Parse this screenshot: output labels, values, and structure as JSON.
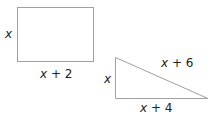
{
  "rectangle": {
    "height_label": "x",
    "width_label_var": "x",
    "width_label_op": " + 2"
  },
  "triangle": {
    "height_label": "x",
    "base_label_var": "x",
    "base_label_op": " + 4",
    "hypotenuse_label_var": "x",
    "hypotenuse_label_op": " + 6"
  },
  "colors": {
    "stroke": "#a0a0a0",
    "text": "#222222"
  }
}
